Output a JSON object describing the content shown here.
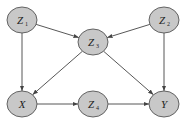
{
  "diagram": {
    "type": "causal-dag",
    "node_fill": "#c8c8c8",
    "node_stroke": "#555555",
    "edge_color": "#444444",
    "nodes": [
      {
        "id": "Z1",
        "label": "Z",
        "sub": "1",
        "cx": 22,
        "cy": 20
      },
      {
        "id": "Z2",
        "label": "Z",
        "sub": "2",
        "cx": 164,
        "cy": 20
      },
      {
        "id": "Z3",
        "label": "Z",
        "sub": "3",
        "cx": 93,
        "cy": 42
      },
      {
        "id": "X",
        "label": "X",
        "sub": "",
        "cx": 22,
        "cy": 104
      },
      {
        "id": "Z4",
        "label": "Z",
        "sub": "4",
        "cx": 93,
        "cy": 104
      },
      {
        "id": "Y",
        "label": "Y",
        "sub": "",
        "cx": 164,
        "cy": 104
      }
    ],
    "edges": [
      {
        "from": "Z1",
        "to": "Z3"
      },
      {
        "from": "Z2",
        "to": "Z3"
      },
      {
        "from": "Z1",
        "to": "X"
      },
      {
        "from": "Z3",
        "to": "X"
      },
      {
        "from": "Z3",
        "to": "Y"
      },
      {
        "from": "Z2",
        "to": "Y"
      },
      {
        "from": "X",
        "to": "Z4"
      },
      {
        "from": "Z4",
        "to": "Y"
      }
    ]
  }
}
